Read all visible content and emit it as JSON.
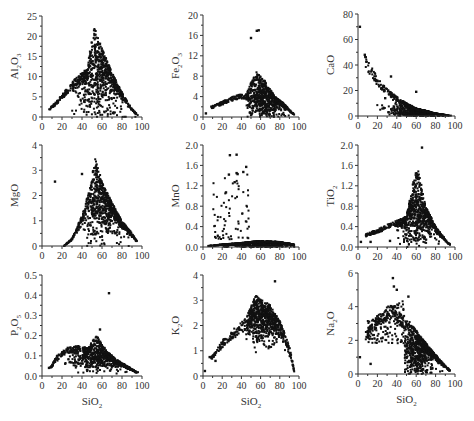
{
  "figure": {
    "x_title": "SiO",
    "x_title_sub": "2"
  },
  "chart_data": [
    {
      "type": "scatter",
      "id": "al2o3",
      "ylabel": "Al2O3",
      "ylabel_parts": [
        "Al",
        "2",
        "O",
        "3"
      ],
      "xlabel": "",
      "xlim": [
        0,
        100
      ],
      "ylim": [
        0,
        25
      ],
      "xticks": [
        0,
        20,
        40,
        60,
        80,
        100
      ],
      "yticks": [
        0,
        5,
        10,
        15,
        20,
        25
      ],
      "grid": false,
      "description": "Triangular distribution: rising lower branch from ~(7,2) to ~(48,12), apex near SiO2 52 at ~22.5, falling branch to ~(95,0.5); dense cloud 45-90",
      "envelope": [
        [
          7,
          2
        ],
        [
          15,
          4
        ],
        [
          25,
          7
        ],
        [
          35,
          10
        ],
        [
          45,
          12
        ],
        [
          52,
          22.5
        ],
        [
          60,
          17
        ],
        [
          70,
          11
        ],
        [
          80,
          6
        ],
        [
          90,
          2
        ],
        [
          96,
          0.5
        ]
      ],
      "density": {
        "x_range": [
          30,
          96
        ],
        "center": [
          58,
          10
        ],
        "spread": [
          13,
          5
        ]
      }
    },
    {
      "type": "scatter",
      "id": "fe2o3",
      "ylabel": "Fe2O3",
      "ylabel_parts": [
        "Fe",
        "2",
        "O",
        "3"
      ],
      "xlabel": "",
      "xlim": [
        0,
        100
      ],
      "ylim": [
        0,
        20
      ],
      "xticks": [
        0,
        20,
        40,
        60,
        80,
        100
      ],
      "yticks": [
        0,
        4,
        8,
        12,
        16,
        20
      ],
      "grid": false,
      "outliers": [
        [
          3,
          0.7
        ],
        [
          50,
          15.5
        ],
        [
          56,
          16.9
        ],
        [
          58,
          17
        ]
      ],
      "description": "Low branch rising from ~(10,2) to ~(45,4.5); dense cluster 50-95 peaking ~9 at SiO2 55, falling to ~0.5 at 95; scattered points 20-40 up to ~9.5",
      "envelope": [
        [
          8,
          2
        ],
        [
          20,
          3
        ],
        [
          35,
          4.3
        ],
        [
          45,
          4.5
        ],
        [
          55,
          9
        ],
        [
          65,
          7
        ],
        [
          75,
          4
        ],
        [
          85,
          2.5
        ],
        [
          95,
          0.5
        ]
      ],
      "density": {
        "x_range": [
          45,
          96
        ],
        "center": [
          65,
          3.5
        ],
        "spread": [
          12,
          1.8
        ]
      }
    },
    {
      "type": "scatter",
      "id": "cao",
      "ylabel": "CaO",
      "ylabel_parts": [
        "CaO"
      ],
      "xlabel": "",
      "xlim": [
        0,
        100
      ],
      "ylim": [
        0,
        80
      ],
      "xticks": [
        0,
        20,
        40,
        60,
        80,
        100
      ],
      "yticks": [
        0,
        20,
        40,
        60,
        80
      ],
      "grid": false,
      "outliers": [
        [
          2,
          70
        ],
        [
          7,
          48
        ],
        [
          8,
          46
        ],
        [
          34,
          31
        ],
        [
          28,
          14
        ],
        [
          60,
          19
        ]
      ],
      "description": "Decreasing curve from ~(7,47) through (20,30), (40,15), (60,6) to ~(95,0); dense cluster 50-90",
      "envelope": [
        [
          7,
          47
        ],
        [
          12,
          41
        ],
        [
          20,
          30
        ],
        [
          30,
          21
        ],
        [
          40,
          15
        ],
        [
          50,
          10
        ],
        [
          60,
          6
        ],
        [
          70,
          4
        ],
        [
          80,
          2
        ],
        [
          95,
          0.3
        ]
      ],
      "density": {
        "x_range": [
          10,
          96
        ],
        "center": [
          62,
          5
        ],
        "spread": [
          14,
          4
        ]
      }
    },
    {
      "type": "scatter",
      "id": "mgo",
      "ylabel": "MgO",
      "ylabel_parts": [
        "MgO"
      ],
      "xlabel": "",
      "xlim": [
        0,
        100
      ],
      "ylim": [
        0,
        4
      ],
      "xticks": [
        0,
        20,
        40,
        60,
        80,
        100
      ],
      "yticks": [
        0,
        1,
        2,
        3,
        4
      ],
      "grid": false,
      "outliers": [
        [
          13,
          2.55
        ],
        [
          40,
          2.85
        ]
      ],
      "description": "Steep rising branch from ~(30,0) to apex ~(53,3.5), falling to ~(95,0.2); dense cluster 50-95",
      "envelope": [
        [
          22,
          0
        ],
        [
          30,
          0.3
        ],
        [
          40,
          1.2
        ],
        [
          48,
          2.3
        ],
        [
          53,
          3.5
        ],
        [
          60,
          2.6
        ],
        [
          70,
          1.7
        ],
        [
          80,
          1
        ],
        [
          90,
          0.5
        ],
        [
          95,
          0.2
        ]
      ],
      "density": {
        "x_range": [
          30,
          96
        ],
        "center": [
          63,
          1.6
        ],
        "spread": [
          12,
          0.7
        ]
      }
    },
    {
      "type": "scatter",
      "id": "mno",
      "ylabel": "MnO",
      "ylabel_parts": [
        "MnO"
      ],
      "xlabel": "",
      "xlim": [
        0,
        100
      ],
      "ylim": [
        0,
        2.0
      ],
      "xticks": [
        0,
        20,
        40,
        60,
        80,
        100
      ],
      "yticks": [
        0.0,
        0.4,
        0.8,
        1.2,
        1.6,
        2.0
      ],
      "ytick_labels": [
        "0.0",
        "0.4",
        "0.8",
        "1.2",
        "1.6",
        "2.0"
      ],
      "grid": false,
      "outliers": [
        [
          28,
          1.8
        ],
        [
          35,
          1.81
        ],
        [
          27,
          1.42
        ],
        [
          35,
          1.45
        ],
        [
          36,
          1.43
        ],
        [
          45,
          1.57
        ],
        [
          42,
          1.47
        ],
        [
          33,
          1.27
        ],
        [
          24,
          1.07
        ]
      ],
      "description": "Most points near 0-0.2 across SiO2 5-95; scattered high values 10-45 up to ~1.8",
      "envelope": [
        [
          5,
          0.02
        ],
        [
          20,
          0.05
        ],
        [
          40,
          0.08
        ],
        [
          60,
          0.12
        ],
        [
          80,
          0.1
        ],
        [
          95,
          0.05
        ]
      ],
      "density": {
        "x_range": [
          15,
          95
        ],
        "center": [
          60,
          0.08
        ],
        "spread": [
          18,
          0.05
        ]
      }
    },
    {
      "type": "scatter",
      "id": "tio2",
      "ylabel": "TiO2",
      "ylabel_parts": [
        "TiO",
        "2"
      ],
      "xlabel": "",
      "xlim": [
        0,
        100
      ],
      "ylim": [
        0,
        2.0
      ],
      "xticks": [
        0,
        20,
        40,
        60,
        80,
        100
      ],
      "yticks": [
        0.0,
        0.4,
        0.8,
        1.2,
        1.6,
        2.0
      ],
      "ytick_labels": [
        "0.0",
        "0.4",
        "0.8",
        "1.2",
        "1.6",
        "2.0"
      ],
      "grid": false,
      "outliers": [
        [
          66,
          1.95
        ],
        [
          3,
          0.1
        ],
        [
          13,
          0.1
        ],
        [
          33,
          0.12
        ]
      ],
      "description": "Rising branch from ~(8,0.25) to ~(50,0.6), apex ~(60,1.55), falling to ~(95,0.05); dense cluster 50-95",
      "envelope": [
        [
          8,
          0.25
        ],
        [
          20,
          0.35
        ],
        [
          35,
          0.48
        ],
        [
          50,
          0.6
        ],
        [
          58,
          1.4
        ],
        [
          62,
          1.55
        ],
        [
          70,
          0.8
        ],
        [
          80,
          0.4
        ],
        [
          90,
          0.15
        ],
        [
          96,
          0.03
        ]
      ],
      "density": {
        "x_range": [
          40,
          96
        ],
        "center": [
          62,
          0.65
        ],
        "spread": [
          11,
          0.3
        ]
      }
    },
    {
      "type": "scatter",
      "id": "p2o5",
      "ylabel": "P2O5",
      "ylabel_parts": [
        "P",
        "2",
        "O",
        "5"
      ],
      "xlabel": "SiO2",
      "xlim": [
        0,
        100
      ],
      "ylim": [
        0,
        0.5
      ],
      "xticks": [
        0,
        20,
        40,
        60,
        80,
        100
      ],
      "yticks": [
        0.0,
        0.1,
        0.2,
        0.3,
        0.4,
        0.5
      ],
      "ytick_labels": [
        "0.0",
        "0.1",
        "0.2",
        "0.3",
        "0.4",
        "0.5"
      ],
      "grid": false,
      "outliers": [
        [
          67,
          0.41
        ],
        [
          34,
          0.07
        ],
        [
          7,
          0.04
        ],
        [
          58,
          0.23
        ]
      ],
      "description": "Hump: rising from ~(8,0.04) to ~(35,0.15), peak cluster ~(55,0.2), falling to ~(95,0.02)",
      "envelope": [
        [
          8,
          0.04
        ],
        [
          15,
          0.1
        ],
        [
          25,
          0.14
        ],
        [
          35,
          0.15
        ],
        [
          45,
          0.14
        ],
        [
          55,
          0.2
        ],
        [
          65,
          0.12
        ],
        [
          75,
          0.08
        ],
        [
          85,
          0.05
        ],
        [
          95,
          0.02
        ]
      ],
      "density": {
        "x_range": [
          10,
          96
        ],
        "center": [
          60,
          0.1
        ],
        "spread": [
          16,
          0.035
        ]
      }
    },
    {
      "type": "scatter",
      "id": "k2o",
      "ylabel": "K2O",
      "ylabel_parts": [
        "K",
        "2",
        "O"
      ],
      "xlabel": "SiO2",
      "xlim": [
        0,
        100
      ],
      "ylim": [
        0,
        4
      ],
      "xticks": [
        0,
        20,
        40,
        60,
        80,
        100
      ],
      "yticks": [
        0,
        1,
        2,
        3,
        4
      ],
      "grid": false,
      "outliers": [
        [
          75,
          3.75
        ],
        [
          2,
          0.2
        ],
        [
          13,
          0.6
        ],
        [
          7,
          0.75
        ]
      ],
      "description": "Linear rising branch from ~(10,0.9) to ~(45,2.3); dense cluster 50-90 between 1.5 and 3.3; tail to ~(95,0.2)",
      "envelope": [
        [
          8,
          0.75
        ],
        [
          20,
          1.4
        ],
        [
          30,
          1.8
        ],
        [
          45,
          2.3
        ],
        [
          55,
          3.2
        ],
        [
          70,
          2.8
        ],
        [
          80,
          2.2
        ],
        [
          90,
          1.2
        ],
        [
          95,
          0.2
        ]
      ],
      "density": {
        "x_range": [
          45,
          95
        ],
        "center": [
          62,
          2.3
        ],
        "spread": [
          11,
          0.5
        ]
      }
    },
    {
      "type": "scatter",
      "id": "na2o",
      "ylabel": "Na2O",
      "ylabel_parts": [
        "Na",
        "2",
        "O"
      ],
      "xlabel": "SiO2",
      "xlim": [
        0,
        100
      ],
      "ylim": [
        0,
        6
      ],
      "xticks": [
        0,
        20,
        40,
        60,
        80,
        100
      ],
      "yticks": [
        0,
        2,
        4,
        6
      ],
      "grid": false,
      "outliers": [
        [
          36,
          5.7
        ],
        [
          2,
          1.0
        ],
        [
          13,
          0.6
        ],
        [
          37,
          5.2
        ],
        [
          40,
          5.0
        ],
        [
          52,
          4.6
        ]
      ],
      "description": "Scattered cloud 10-45 between 2 and 4.5; dense decreasing cluster 50-95 from ~3 to ~0.2",
      "envelope": [
        [
          8,
          2.5
        ],
        [
          20,
          3.5
        ],
        [
          35,
          4.2
        ],
        [
          45,
          3.5
        ],
        [
          55,
          3
        ],
        [
          65,
          2.2
        ],
        [
          75,
          1.5
        ],
        [
          85,
          0.8
        ],
        [
          95,
          0.2
        ]
      ],
      "density": {
        "x_range": [
          48,
          96
        ],
        "center": [
          63,
          1.5
        ],
        "spread": [
          11,
          0.75
        ]
      }
    }
  ]
}
